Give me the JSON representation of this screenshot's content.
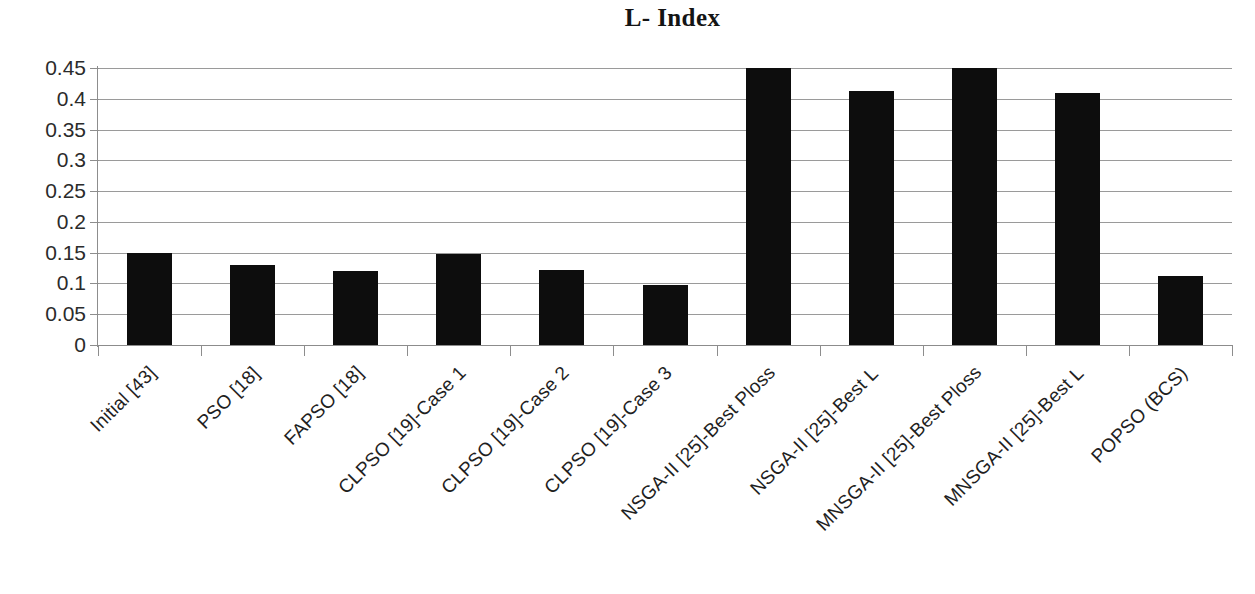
{
  "chart_data": {
    "type": "bar",
    "title": "L- Index",
    "xlabel": "",
    "ylabel": "",
    "ylim": [
      0,
      0.45
    ],
    "grid": true,
    "legend": false,
    "y_ticks": [
      "0.45",
      "0.4",
      "0.35",
      "0.3",
      "0.25",
      "0.2",
      "0.15",
      "0.1",
      "0.05",
      "0"
    ],
    "y_tick_values": [
      0.45,
      0.4,
      0.35,
      0.3,
      0.25,
      0.2,
      0.15,
      0.1,
      0.05,
      0
    ],
    "categories": [
      "Initial [43]",
      "PSO [18]",
      "FAPSO [18]",
      "CLPSO [19]-Case 1",
      "CLPSO [19]-Case 2",
      "CLPSO [19]-Case 3",
      "NSGA-II [25]-Best Ploss",
      "NSGA-II [25]-Best L",
      "MNSGA-II [25]-Best Ploss",
      "MNSGA-II [25]-Best L",
      "POPSO (BCS)"
    ],
    "values": [
      0.15,
      0.13,
      0.12,
      0.148,
      0.122,
      0.098,
      0.45,
      0.413,
      0.45,
      0.41,
      0.112
    ],
    "bar_color": "#0d0d0d",
    "grid_color": "#9a9a9a"
  }
}
